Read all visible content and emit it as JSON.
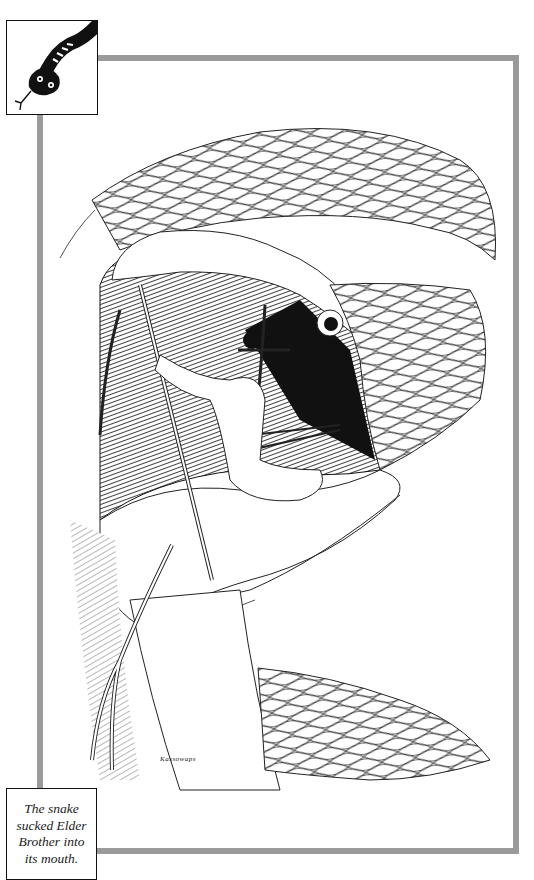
{
  "page": {
    "type": "book-illustration-page",
    "frame_color": "#9a9a9a"
  },
  "corner_icon": {
    "name": "snake-icon",
    "description": "black snake head with striped neck and forked tongue"
  },
  "illustration": {
    "subject": "Large snake with open mouth; a man (Elder Brother) inside the mouth holding poles propping the jaws open",
    "signature": "Kassowaps"
  },
  "caption": {
    "lines": [
      "The snake",
      "sucked Elder",
      "Brother into",
      "its mouth."
    ],
    "text": "The snake sucked Elder Brother into its mouth."
  }
}
